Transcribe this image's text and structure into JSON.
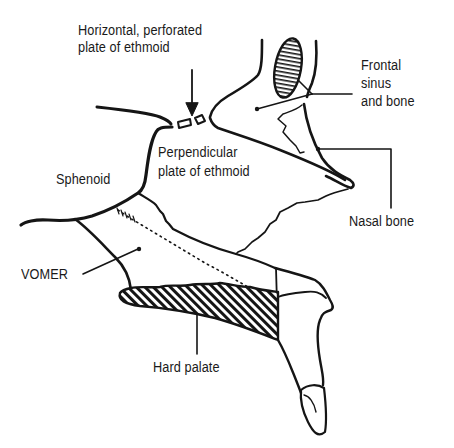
{
  "diagram": {
    "colors": {
      "line": "#151515",
      "background": "#ffffff",
      "hatch": "#151515"
    },
    "labels": {
      "horizontal_plate": {
        "line1": "Horizontal, perforated",
        "line2": "plate of ethmoid"
      },
      "frontal": {
        "line1": "Frontal",
        "line2": "sinus",
        "line3": "and bone"
      },
      "perpendicular_plate": {
        "line1": "Perpendicular",
        "line2": "plate of ethmoid"
      },
      "sphenoid": "Sphenoid",
      "nasal_bone": "Nasal bone",
      "vomer": "VOMER",
      "hard_palate": "Hard palate"
    }
  }
}
